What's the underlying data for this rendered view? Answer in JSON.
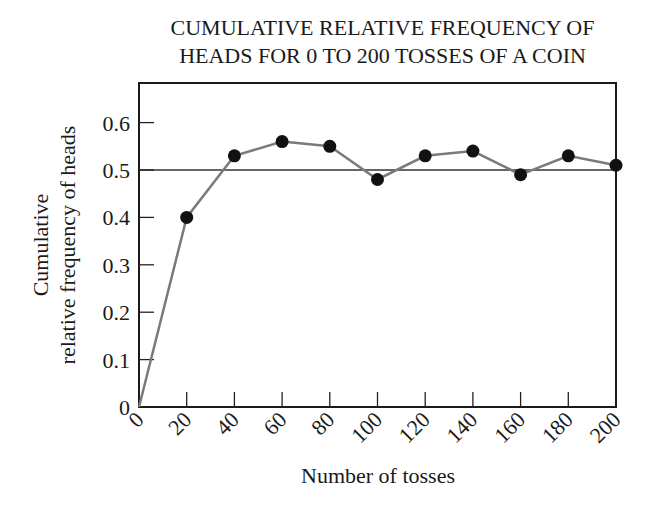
{
  "chart_data": {
    "type": "line",
    "title": "CUMULATIVE RELATIVE FREQUENCY OF HEADS FOR 0 TO 200 TOSSES OF A COIN",
    "title_lines": [
      "CUMULATIVE RELATIVE FREQUENCY OF",
      "HEADS FOR 0 TO 200 TOSSES OF A COIN"
    ],
    "xlabel": "Number of tosses",
    "ylabel_lines": [
      "Cumulative",
      "relative frequency of heads"
    ],
    "x": [
      0,
      20,
      40,
      60,
      80,
      100,
      120,
      140,
      160,
      180,
      200
    ],
    "series": [
      {
        "name": "Cumulative relative frequency of heads",
        "values": [
          0,
          0.4,
          0.53,
          0.56,
          0.55,
          0.48,
          0.53,
          0.54,
          0.49,
          0.53,
          0.51
        ]
      }
    ],
    "reference_line": {
      "y": 0.5
    },
    "xlim": [
      0,
      200
    ],
    "ylim": [
      0,
      0.68
    ],
    "xticks": [
      "0",
      "20",
      "40",
      "60",
      "80",
      "100",
      "120",
      "140",
      "160",
      "180",
      "200"
    ],
    "yticks": [
      "0",
      "0.1",
      "0.2",
      "0.3",
      "0.4",
      "0.5",
      "0.6"
    ],
    "grid": false,
    "legend": null,
    "colors": {
      "line": "#7a7a7a",
      "marker": "#111111",
      "axis": "#1a1a1a"
    }
  }
}
